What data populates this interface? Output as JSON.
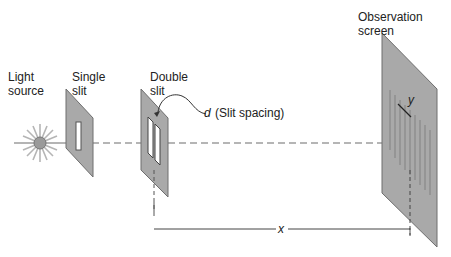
{
  "diagram": {
    "labels": {
      "light_source": [
        "Light",
        "source"
      ],
      "single_slit": [
        "Single",
        "slit"
      ],
      "double_slit": [
        "Double",
        "slit"
      ],
      "slit_spacing_symbol": "d",
      "slit_spacing_text": "(Slit spacing)",
      "observation_screen": [
        "Observation",
        "screen"
      ],
      "fringe_spacing_symbol": "y",
      "distance_symbol": "x"
    },
    "colors": {
      "plate_fill": "#a9a9a9",
      "plate_stroke": "#6e6e6e",
      "beam": "#b5b5b5",
      "source_fill": "#9a9a9a",
      "line": "#333333"
    }
  }
}
